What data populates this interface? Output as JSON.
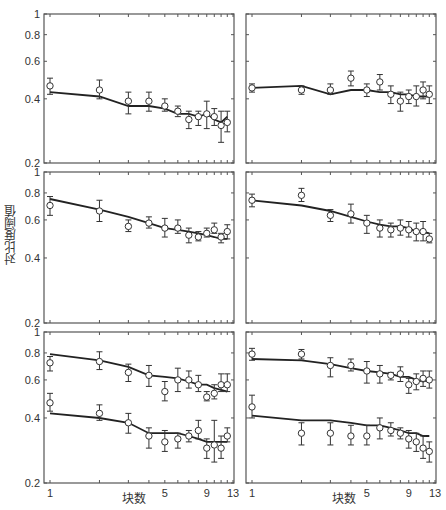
{
  "chart_data": {
    "type": "line",
    "layout": "3x2 grid of panels, shared log-scaled axes",
    "ylabel": "对比度阈值",
    "xlabel": "块数",
    "x_scale": "log",
    "y_scale": "log",
    "xlim": [
      1,
      13
    ],
    "ylim": [
      0.2,
      1
    ],
    "xticks": [
      1,
      5,
      9,
      13
    ],
    "yticks": [
      0.2,
      0.4,
      0.6,
      0.8,
      1
    ],
    "ytick_labels": [
      "0.2",
      "0.4",
      "0.6",
      "0.8",
      "1"
    ],
    "grid": false,
    "legend": null,
    "marker": "open circle with error bars; solid line = model fit",
    "x": [
      1,
      2,
      3,
      4,
      5,
      6,
      7,
      8,
      9,
      10,
      11,
      12
    ],
    "panels": [
      {
        "row": 0,
        "col": 0,
        "series": [
          {
            "name": "data",
            "values": [
              0.46,
              0.44,
              0.39,
              0.39,
              0.37,
              0.35,
              0.32,
              0.33,
              0.34,
              0.33,
              0.3,
              0.31
            ],
            "err_low": [
              0.42,
              0.4,
              0.34,
              0.35,
              0.35,
              0.33,
              0.29,
              0.3,
              0.29,
              0.3,
              0.25,
              0.28
            ],
            "err_high": [
              0.5,
              0.49,
              0.43,
              0.43,
              0.4,
              0.37,
              0.35,
              0.35,
              0.39,
              0.36,
              0.35,
              0.35
            ],
            "fit": [
              0.43,
              0.41,
              0.37,
              0.37,
              0.36,
              0.34,
              0.34,
              0.33,
              0.34,
              0.32,
              0.31,
              0.33
            ]
          }
        ]
      },
      {
        "row": 0,
        "col": 1,
        "series": [
          {
            "name": "data",
            "values": [
              0.45,
              0.44,
              0.44,
              0.5,
              0.44,
              0.48,
              0.42,
              0.39,
              0.41,
              0.41,
              0.44,
              0.42
            ],
            "err_low": [
              0.43,
              0.42,
              0.42,
              0.46,
              0.41,
              0.44,
              0.38,
              0.35,
              0.38,
              0.37,
              0.4,
              0.38
            ],
            "err_high": [
              0.47,
              0.46,
              0.47,
              0.54,
              0.47,
              0.52,
              0.46,
              0.43,
              0.44,
              0.46,
              0.48,
              0.46
            ],
            "fit": [
              0.45,
              0.46,
              0.42,
              0.44,
              0.44,
              0.43,
              0.43,
              0.42,
              0.42,
              0.41,
              0.41,
              0.41
            ]
          }
        ]
      },
      {
        "row": 1,
        "col": 0,
        "series": [
          {
            "name": "data",
            "values": [
              0.7,
              0.66,
              0.56,
              0.58,
              0.55,
              0.55,
              0.51,
              0.5,
              0.52,
              0.54,
              0.5,
              0.53
            ],
            "err_low": [
              0.63,
              0.59,
              0.53,
              0.55,
              0.5,
              0.52,
              0.47,
              0.48,
              0.5,
              0.52,
              0.47,
              0.49
            ],
            "err_high": [
              0.77,
              0.74,
              0.6,
              0.62,
              0.61,
              0.6,
              0.55,
              0.53,
              0.55,
              0.58,
              0.52,
              0.57
            ],
            "fit": [
              0.75,
              0.67,
              0.62,
              0.58,
              0.55,
              0.54,
              0.53,
              0.52,
              0.51,
              0.5,
              0.49,
              0.49
            ]
          }
        ]
      },
      {
        "row": 1,
        "col": 1,
        "series": [
          {
            "name": "data",
            "values": [
              0.74,
              0.78,
              0.63,
              0.64,
              0.58,
              0.55,
              0.54,
              0.55,
              0.54,
              0.53,
              0.53,
              0.49
            ],
            "err_low": [
              0.69,
              0.73,
              0.59,
              0.58,
              0.52,
              0.5,
              0.5,
              0.51,
              0.5,
              0.48,
              0.48,
              0.47
            ],
            "err_high": [
              0.79,
              0.84,
              0.67,
              0.71,
              0.63,
              0.6,
              0.58,
              0.6,
              0.59,
              0.58,
              0.59,
              0.52
            ],
            "fit": [
              0.74,
              0.7,
              0.66,
              0.62,
              0.59,
              0.57,
              0.56,
              0.56,
              0.55,
              0.53,
              0.53,
              0.52
            ]
          }
        ]
      },
      {
        "row": 2,
        "col": 0,
        "series": [
          {
            "name": "upper",
            "values": [
              0.72,
              0.73,
              0.65,
              0.63,
              0.53,
              0.6,
              0.6,
              0.57,
              0.5,
              0.52,
              0.57,
              0.57
            ],
            "err_low": [
              0.66,
              0.67,
              0.59,
              0.56,
              0.48,
              0.53,
              0.55,
              0.53,
              0.48,
              0.49,
              0.53,
              0.53
            ],
            "err_high": [
              0.77,
              0.81,
              0.71,
              0.7,
              0.59,
              0.68,
              0.66,
              0.63,
              0.53,
              0.57,
              0.64,
              0.64
            ],
            "fit": [
              0.79,
              0.74,
              0.69,
              0.63,
              0.62,
              0.61,
              0.59,
              0.57,
              0.57,
              0.55,
              0.54,
              0.53
            ]
          },
          {
            "name": "lower",
            "values": [
              0.47,
              0.42,
              0.38,
              0.33,
              0.31,
              0.32,
              0.33,
              0.35,
              0.29,
              0.3,
              0.29,
              0.33
            ],
            "err_low": [
              0.43,
              0.39,
              0.34,
              0.29,
              0.28,
              0.29,
              0.31,
              0.32,
              0.26,
              0.25,
              0.26,
              0.31
            ],
            "err_high": [
              0.52,
              0.46,
              0.42,
              0.36,
              0.35,
              0.34,
              0.35,
              0.39,
              0.32,
              0.39,
              0.33,
              0.36
            ],
            "fit": [
              0.42,
              0.4,
              0.38,
              0.34,
              0.34,
              0.34,
              0.33,
              0.32,
              0.31,
              0.31,
              0.31,
              0.31
            ]
          }
        ]
      },
      {
        "row": 2,
        "col": 1,
        "series": [
          {
            "name": "upper",
            "values": [
              0.79,
              0.79,
              0.7,
              0.7,
              0.66,
              0.64,
              0.63,
              0.64,
              0.57,
              0.59,
              0.61,
              0.6
            ],
            "err_low": [
              0.74,
              0.75,
              0.62,
              0.66,
              0.58,
              0.58,
              0.6,
              0.59,
              0.52,
              0.54,
              0.56,
              0.55
            ],
            "err_high": [
              0.84,
              0.83,
              0.76,
              0.75,
              0.73,
              0.7,
              0.65,
              0.69,
              0.61,
              0.64,
              0.66,
              0.66
            ],
            "fit": [
              0.75,
              0.74,
              0.71,
              0.68,
              0.66,
              0.65,
              0.64,
              0.62,
              0.62,
              0.6,
              0.59,
              0.6
            ]
          },
          {
            "name": "lower",
            "values": [
              0.45,
              0.34,
              0.34,
              0.33,
              0.33,
              0.36,
              0.35,
              0.34,
              0.32,
              0.31,
              0.29,
              0.28
            ],
            "err_low": [
              0.4,
              0.3,
              0.3,
              0.3,
              0.3,
              0.32,
              0.33,
              0.32,
              0.29,
              0.28,
              0.26,
              0.25
            ],
            "err_high": [
              0.51,
              0.38,
              0.38,
              0.37,
              0.37,
              0.4,
              0.38,
              0.36,
              0.35,
              0.34,
              0.33,
              0.31
            ],
            "fit": [
              0.41,
              0.39,
              0.39,
              0.38,
              0.37,
              0.37,
              0.36,
              0.35,
              0.34,
              0.34,
              0.33,
              0.33
            ]
          }
        ]
      }
    ]
  },
  "axes": {
    "ylabel": "对比度阈值",
    "xlabel": "块数"
  }
}
